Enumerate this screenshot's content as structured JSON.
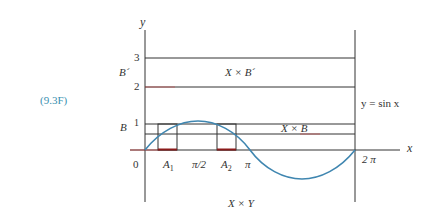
{
  "equation_label": "(9.3F)",
  "axes": {
    "x_label": "x",
    "y_label": "y"
  },
  "y_ticks": [
    "3",
    "2",
    "1"
  ],
  "x_ticks": [
    "0",
    "π/2",
    "π",
    "2 π"
  ],
  "set_labels": {
    "B_prime": "B´",
    "B": "B",
    "A1": "A",
    "A1_sub": "1",
    "A2": "A",
    "A2_sub": "2"
  },
  "region_labels": {
    "X_times_B_prime": "X × B´",
    "X_times_B": "X × B",
    "X_times_Y": "X × Y"
  },
  "curve_label": "y = sin x",
  "colors": {
    "curve": "#3f86b0",
    "lines": "#333333",
    "red_accent": "#d04040",
    "equation": "#3a8fb0"
  }
}
